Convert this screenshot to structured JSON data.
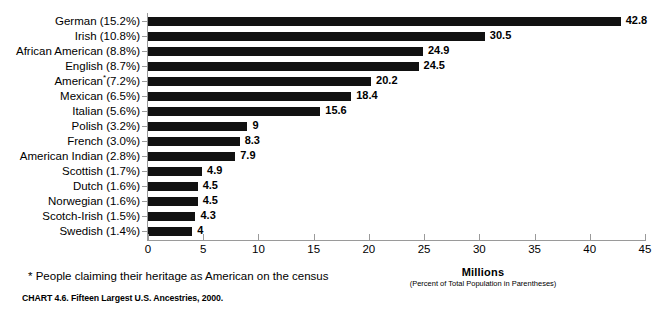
{
  "chart_data": {
    "type": "bar",
    "orientation": "horizontal",
    "title": "",
    "caption": "CHART 4.6. Fifteen Largest U.S. Ancestries, 2000.",
    "xlabel": "Millions",
    "xlabel_subtitle": "(Percent of Total Population in Parentheses)",
    "ylabel": "",
    "xlim": [
      0,
      45
    ],
    "xticks": [
      0,
      5,
      10,
      15,
      20,
      25,
      30,
      35,
      40,
      45
    ],
    "xtick_labels": [
      "0",
      "5",
      "10",
      "15",
      "20",
      "25",
      "30",
      "35",
      "40",
      "45"
    ],
    "grid": false,
    "legend": false,
    "bar_color": "#111111",
    "axis_color": "#9a9a9a",
    "footnote": "* People claiming their heritage as American on the census",
    "categories": [
      "German (15.2%)",
      "Irish (10.8%)",
      "African American (8.8%)",
      "English (8.7%)",
      "American*(7.2%)",
      "Mexican (6.5%)",
      "Italian (5.6%)",
      "Polish (3.2%)",
      "French (3.0%)",
      "American Indian (2.8%)",
      "Scottish (1.7%)",
      "Dutch (1.6%)",
      "Norwegian (1.6%)",
      "Scotch-Irish (1.5%)",
      "Swedish (1.4%)"
    ],
    "values": [
      42.8,
      30.5,
      24.9,
      24.5,
      20.2,
      18.4,
      15.6,
      9,
      8.3,
      7.9,
      4.9,
      4.5,
      4.5,
      4.3,
      4
    ],
    "value_labels": [
      "42.8",
      "30.5",
      "24.9",
      "24.5",
      "20.2",
      "18.4",
      "15.6",
      "9",
      "8.3",
      "7.9",
      "4.9",
      "4.5",
      "4.5",
      "4.3",
      "4"
    ],
    "percent_labels": [
      "15.2%",
      "10.8%",
      "8.8%",
      "8.7%",
      "7.2%",
      "6.5%",
      "5.6%",
      "3.2%",
      "3.0%",
      "2.8%",
      "1.7%",
      "1.6%",
      "1.6%",
      "1.5%",
      "1.4%"
    ],
    "category_names": [
      "German",
      "Irish",
      "African American",
      "English",
      "American",
      "Mexican",
      "Italian",
      "Polish",
      "French",
      "American Indian",
      "Scottish",
      "Dutch",
      "Norwegian",
      "Scotch-Irish",
      "Swedish"
    ],
    "footnote_marker_category": "American"
  }
}
